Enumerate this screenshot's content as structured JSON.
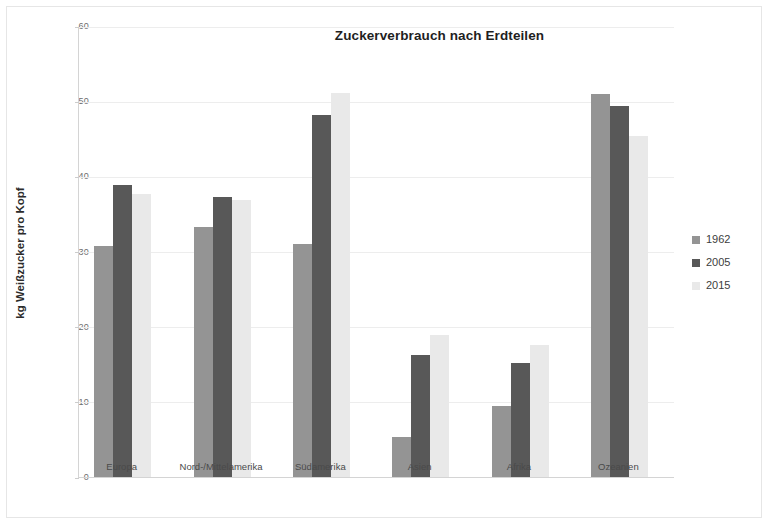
{
  "chart_data": {
    "type": "bar",
    "title": "Zuckerverbrauch nach Erdteilen",
    "xlabel": "",
    "ylabel": "kg Weißzucker pro Kopf",
    "ylim": [
      0,
      60
    ],
    "yticks": [
      0,
      10,
      20,
      30,
      40,
      50,
      60
    ],
    "ytick_labels": [
      "0",
      "10",
      "20",
      "30",
      "40",
      "50",
      "60"
    ],
    "grid": true,
    "legend_position": "right",
    "categories": [
      "Europa",
      "Nord-/Mittelamerika",
      "Südamerika",
      "Asien",
      "Afrika",
      "Ozeanien"
    ],
    "series": [
      {
        "name": "1962",
        "color": "#949494",
        "values": [
          30.8,
          33.2,
          31.0,
          5.3,
          9.5,
          50.9
        ]
      },
      {
        "name": "2005",
        "color": "#585858",
        "values": [
          38.8,
          37.2,
          48.1,
          16.2,
          15.2,
          49.4
        ]
      },
      {
        "name": "2015",
        "color": "#e9e9e9",
        "values": [
          37.7,
          36.8,
          51.1,
          18.9,
          17.6,
          45.4
        ]
      }
    ]
  },
  "legend": {
    "items": [
      {
        "label": "1962",
        "color": "#949494"
      },
      {
        "label": "2005",
        "color": "#585858"
      },
      {
        "label": "2015",
        "color": "#e9e9e9"
      }
    ]
  }
}
